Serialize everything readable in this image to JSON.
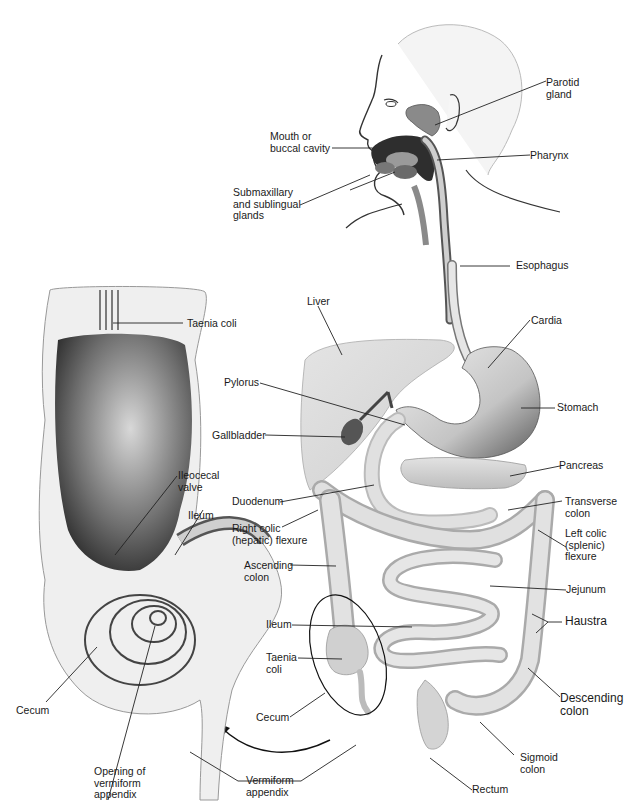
{
  "figure": {
    "labels": {
      "parotid_gland": "Parotid\ngland",
      "mouth": "Mouth or\nbuccal cavity",
      "pharynx": "Pharynx",
      "submaxillary": "Submaxillary\nand sublingual\nglands",
      "esophagus": "Esophagus",
      "taenia_coli_detail": "Taenia coli",
      "liver": "Liver",
      "cardia": "Cardia",
      "pylorus": "Pylorus",
      "stomach": "Stomach",
      "gallbladder": "Gallbladder",
      "pancreas": "Pancreas",
      "ileocecal_valve": "Ileocecal\nvalve",
      "duodenum": "Duodenum",
      "transverse_colon": "Transverse\ncolon",
      "ileum_detail": "Ileum",
      "right_colic_flexure": "Right colic\n(hepatic) flexure",
      "left_colic_flexure": "Left colic\n(splenic)\nflexure",
      "ascending_colon": "Ascending\ncolon",
      "jejunum": "Jejunum",
      "ileum": "Ileum",
      "haustra": "Haustra",
      "taenia_coli": "Taenia\ncoli",
      "cecum_detail": "Cecum",
      "cecum": "Cecum",
      "descending_colon": "Descending\ncolon",
      "sigmoid_colon": "Sigmoid\ncolon",
      "vermiform_appendix": "Vermiform\nappendix",
      "rectum": "Rectum",
      "opening_appendix": "Opening of\nvermiform\nappendix"
    }
  }
}
